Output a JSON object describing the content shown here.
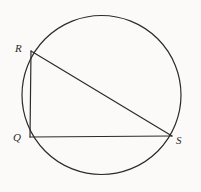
{
  "figure": {
    "background_color": "#fbfaf8",
    "stroke_color": "#2b2b2b",
    "label_color": "#2b2b2b",
    "stroke_width": 1.2,
    "circle": {
      "name": "circumscribed-circle",
      "center_x": 101.5,
      "center_y": 95,
      "radius": 79.5
    },
    "vertices": [
      {
        "id": "R",
        "label": "R",
        "x": 31,
        "y": 51
      },
      {
        "id": "Q",
        "label": "Q",
        "x": 30,
        "y": 137
      },
      {
        "id": "S",
        "label": "S",
        "x": 172,
        "y": 136
      }
    ],
    "segments": [
      {
        "id": "RQ",
        "from": "R",
        "to": "Q",
        "x1": 31,
        "y1": 51,
        "x2": 30,
        "y2": 137
      },
      {
        "id": "QS",
        "from": "Q",
        "to": "S",
        "x1": 30,
        "y1": 137,
        "x2": 172,
        "y2": 136
      },
      {
        "id": "RS",
        "from": "R",
        "to": "S",
        "x1": 31,
        "y1": 51,
        "x2": 172,
        "y2": 136
      }
    ]
  }
}
